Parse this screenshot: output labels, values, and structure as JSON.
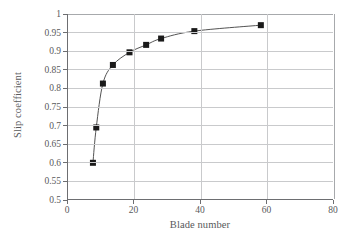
{
  "chart_data": {
    "type": "line",
    "title": "",
    "xlabel": "Blade number",
    "ylabel": "Slip coefficient",
    "xlim": [
      0,
      80
    ],
    "ylim": [
      0.5,
      1
    ],
    "xticks": [
      0,
      20,
      40,
      60,
      80
    ],
    "yticks": [
      0.5,
      0.55,
      0.6,
      0.65,
      0.7,
      0.75,
      0.8,
      0.85,
      0.9,
      0.95,
      1
    ],
    "xtick_labels": [
      "0",
      "20",
      "40",
      "60",
      "80"
    ],
    "ytick_labels": [
      "0.5",
      "0.55",
      "0.6",
      "0.65",
      "0.7",
      "0.75",
      "0.8",
      "0.85",
      "0.9",
      "0.95",
      "1"
    ],
    "grid": "both",
    "legend": "none",
    "marker": "square",
    "marker_color": "#1a1a1a",
    "line_color": "#404040",
    "x": [
      7.5,
      8.5,
      10.5,
      13.5,
      18.5,
      23.5,
      28.0,
      38.0,
      58.0
    ],
    "y": [
      0.6,
      0.695,
      0.813,
      0.863,
      0.897,
      0.917,
      0.934,
      0.954,
      0.97
    ],
    "series": [
      {
        "name": "Slip coefficient vs blade number",
        "points": [
          {
            "x": 7.5,
            "y": 0.6
          },
          {
            "x": 8.5,
            "y": 0.695
          },
          {
            "x": 10.5,
            "y": 0.813
          },
          {
            "x": 13.5,
            "y": 0.863
          },
          {
            "x": 18.5,
            "y": 0.897
          },
          {
            "x": 23.5,
            "y": 0.917
          },
          {
            "x": 28.0,
            "y": 0.934
          },
          {
            "x": 38.0,
            "y": 0.954
          },
          {
            "x": 58.0,
            "y": 0.97
          }
        ]
      }
    ]
  },
  "axes": {
    "x_title": "Blade number",
    "y_title": "Slip coefficient"
  },
  "colors": {
    "grid": "#c9cacc",
    "axis": "#6d6e71",
    "text": "#58595b",
    "marker": "#1a1a1a",
    "line": "#404040",
    "background": "#ffffff"
  }
}
